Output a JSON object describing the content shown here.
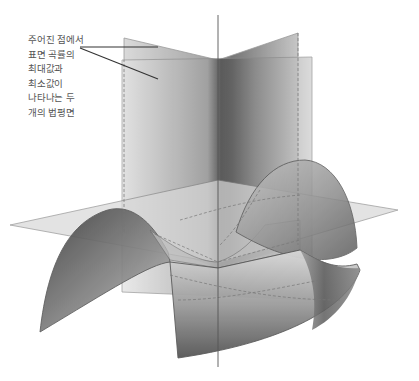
{
  "figure": {
    "cut_heading": "· ·  · ·    ·· · ·",
    "caption_lines": [
      "주어진 점에서",
      "표면 곡률의",
      "최대값과",
      "최소값이",
      "나타나는 두",
      "개의 법평면"
    ],
    "colors": {
      "surface_dark": "#3a3a3a",
      "surface_light": "#e6e6e6",
      "plane_fill": "#cfcfcf",
      "edge": "#6a6a6a",
      "leader_line": "#333333"
    }
  }
}
